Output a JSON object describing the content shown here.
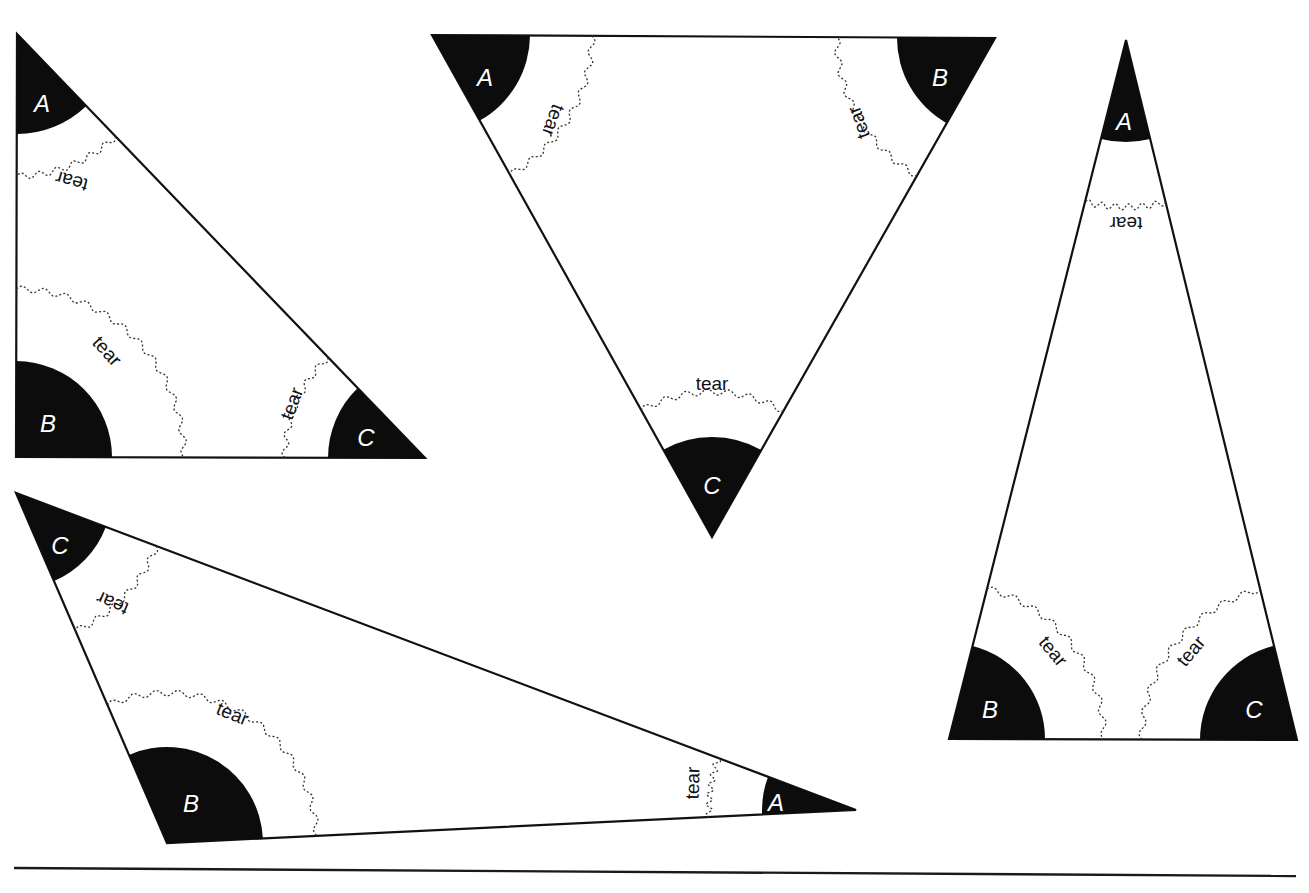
{
  "colors": {
    "sector_fill": "#0c0c0c",
    "outline": "#111111",
    "tear_line": "#333333",
    "background": "#ffffff"
  },
  "tear_text": "tear",
  "triangles": [
    {
      "id": "right-triangle",
      "vertices": [
        {
          "label": "A",
          "x": 17,
          "y": 34,
          "r": 100,
          "label_x": 42,
          "label_y": 106
        },
        {
          "label": "B",
          "x": 16,
          "y": 457,
          "r": 96,
          "label_x": 48,
          "label_y": 426
        },
        {
          "label": "C",
          "x": 425,
          "y": 458,
          "r": 97,
          "label_x": 366,
          "label_y": 440
        }
      ],
      "tears": [
        {
          "vertex": 0,
          "r": 142,
          "label_x": 72,
          "label_y": 180,
          "rotate": 195
        },
        {
          "vertex": 1,
          "r": 168,
          "label_x": 106,
          "label_y": 352,
          "rotate": 48
        },
        {
          "vertex": 2,
          "r": 140,
          "label_x": 293,
          "label_y": 404,
          "rotate": -70
        }
      ]
    },
    {
      "id": "equilateral-inverted",
      "vertices": [
        {
          "label": "A",
          "x": 432,
          "y": 35,
          "r": 98,
          "label_x": 485,
          "label_y": 80
        },
        {
          "label": "B",
          "x": 995,
          "y": 38,
          "r": 98,
          "label_x": 940,
          "label_y": 80
        },
        {
          "label": "C",
          "x": 712,
          "y": 537,
          "r": 100,
          "label_x": 712,
          "label_y": 488
        }
      ],
      "tears": [
        {
          "vertex": 0,
          "r": 160,
          "label_x": 552,
          "label_y": 120,
          "rotate": 110
        },
        {
          "vertex": 1,
          "r": 158,
          "label_x": 860,
          "label_y": 122,
          "rotate": -110
        },
        {
          "vertex": 2,
          "r": 145,
          "label_x": 712,
          "label_y": 385,
          "rotate": 0
        }
      ]
    },
    {
      "id": "tall-isosceles",
      "vertices": [
        {
          "label": "A",
          "x": 1126,
          "y": 40,
          "r": 102,
          "label_x": 1124,
          "label_y": 124
        },
        {
          "label": "B",
          "x": 949,
          "y": 739,
          "r": 96,
          "label_x": 990,
          "label_y": 712
        },
        {
          "label": "C",
          "x": 1297,
          "y": 740,
          "r": 97,
          "label_x": 1254,
          "label_y": 712
        }
      ],
      "tears": [
        {
          "vertex": 0,
          "r": 167,
          "label_x": 1126,
          "label_y": 222,
          "rotate": 180
        },
        {
          "vertex": 1,
          "r": 155,
          "label_x": 1052,
          "label_y": 652,
          "rotate": 50
        },
        {
          "vertex": 2,
          "r": 155,
          "label_x": 1192,
          "label_y": 652,
          "rotate": -50
        }
      ]
    },
    {
      "id": "obtuse-triangle",
      "vertices": [
        {
          "label": "A",
          "x": 856,
          "y": 810,
          "r": 94,
          "label_x": 776,
          "label_y": 805
        },
        {
          "label": "B",
          "x": 167,
          "y": 843,
          "r": 96,
          "label_x": 191,
          "label_y": 806
        },
        {
          "label": "C",
          "x": 16,
          "y": 493,
          "r": 96,
          "label_x": 60,
          "label_y": 548
        }
      ],
      "tears": [
        {
          "vertex": 0,
          "r": 147,
          "label_x": 694,
          "label_y": 783,
          "rotate": -88
        },
        {
          "vertex": 1,
          "r": 150,
          "label_x": 232,
          "label_y": 715,
          "rotate": 22
        },
        {
          "vertex": 2,
          "r": 150,
          "label_x": 113,
          "label_y": 602,
          "rotate": 204
        }
      ]
    }
  ],
  "rule": {
    "x1": 14,
    "y1": 868,
    "x2": 1296,
    "y2": 876
  }
}
